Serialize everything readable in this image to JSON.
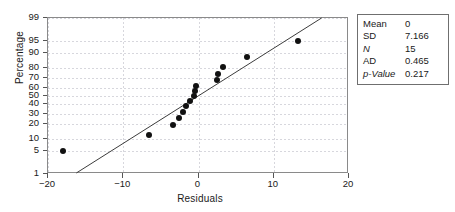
{
  "chart_data": {
    "type": "scatter",
    "title": "",
    "xlabel": "Residuals",
    "ylabel": "Percentage",
    "xlim": [
      -20,
      20
    ],
    "ylim": [
      1,
      99
    ],
    "grid": true,
    "yscale": "normal-probability",
    "xticks": [
      -20,
      -10,
      0,
      10,
      20
    ],
    "xticklabels": [
      "−20",
      "−10",
      "0",
      "10",
      "20"
    ],
    "yticks": [
      1,
      5,
      10,
      20,
      30,
      40,
      50,
      60,
      70,
      80,
      90,
      95,
      99
    ],
    "yticklabels": [
      "1",
      "5",
      "10",
      "20",
      "30",
      "40",
      "50",
      "60",
      "70",
      "80",
      "90",
      "95",
      "99"
    ],
    "series": [
      {
        "name": "residual-points",
        "marker": "filled-circle",
        "color": "#111111",
        "points": [
          {
            "x": -18.0,
            "y": 5
          },
          {
            "x": -6.6,
            "y": 12
          },
          {
            "x": -3.4,
            "y": 19
          },
          {
            "x": -2.6,
            "y": 26
          },
          {
            "x": -2.1,
            "y": 32
          },
          {
            "x": -1.6,
            "y": 38
          },
          {
            "x": -1.1,
            "y": 44
          },
          {
            "x": -0.6,
            "y": 50
          },
          {
            "x": -0.5,
            "y": 56
          },
          {
            "x": -0.3,
            "y": 62
          },
          {
            "x": 2.5,
            "y": 68
          },
          {
            "x": 2.6,
            "y": 74
          },
          {
            "x": 3.3,
            "y": 81
          },
          {
            "x": 6.5,
            "y": 88
          },
          {
            "x": 13.2,
            "y": 95
          }
        ]
      }
    ],
    "fit_line": {
      "name": "normal-reference-line",
      "color": "#3a3a3a",
      "x_start": -16.2,
      "y_start": 1,
      "x_end": 16.6,
      "y_end": 99
    },
    "legend_position": "outside-right"
  },
  "stats_box": {
    "name": "anderson-darling-summary",
    "rows": [
      {
        "label": "Mean",
        "value": "0",
        "italic_label": false
      },
      {
        "label": "SD",
        "value": "7.166",
        "italic_label": false
      },
      {
        "label": "N",
        "value": "15",
        "italic_label": true
      },
      {
        "label": "AD",
        "value": "0.465",
        "italic_label": false
      },
      {
        "label": "p-Value",
        "value": "0.217",
        "italic_label": true
      }
    ]
  },
  "colors": {
    "point": "#111111",
    "line": "#3a3a3a",
    "frame": "#8a8a8a",
    "grid": "#d7d7dd",
    "text": "#1a1a1a"
  }
}
